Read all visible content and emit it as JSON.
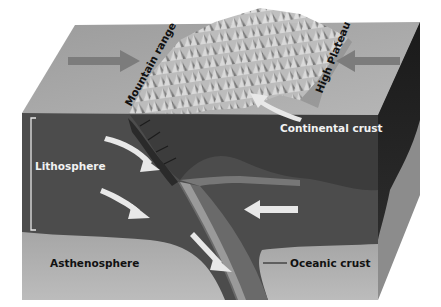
{
  "diagram": {
    "type": "block-diagram",
    "labels": {
      "mountain_range": "Mountain range",
      "high_plateau": "High Plateau",
      "continental_crust": "Continental crust",
      "lithosphere": "Lithosphere",
      "asthenosphere": "Asthenosphere",
      "oceanic_crust": "Oceanic crust"
    },
    "arrows": [
      {
        "id": "left-surface-arrow",
        "direction": "right"
      },
      {
        "id": "right-surface-arrow",
        "direction": "left"
      },
      {
        "id": "continental-curved-arrow",
        "direction": "up-left"
      },
      {
        "id": "lithosphere-arrow-1",
        "direction": "down-right"
      },
      {
        "id": "lithosphere-arrow-2",
        "direction": "down-right"
      },
      {
        "id": "oceanic-plate-arrow",
        "direction": "left"
      },
      {
        "id": "subducting-slab-arrow",
        "direction": "down-right"
      }
    ],
    "colors": {
      "background": "#ffffff",
      "top_surface": "#a8a8a8",
      "mountains_light": "#d0d0d0",
      "mountains_dark": "#6e6e6e",
      "lithosphere": "#4a4a4a",
      "continental_crust": "#3f3f3f",
      "asthenosphere": "#b0b0b0",
      "slab": "#7a7a7a",
      "side_dark": "#1e1e1e",
      "side_light": "#8a8a8a",
      "arrow_light": "#e8e8e8",
      "arrow_surface": "#7c7c7c"
    }
  }
}
